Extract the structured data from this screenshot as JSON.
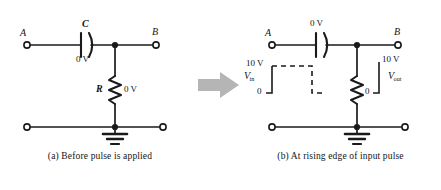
{
  "figure": {
    "type": "circuit-diagram",
    "background_color": "#ffffff",
    "line_color": "#1a1a1a",
    "arrow_color": "#b3b3b3",
    "transition_arrow": "right-arrow"
  },
  "panel_a": {
    "caption": "(a) Before pulse is applied",
    "terminal_top_left": "A",
    "terminal_top_right": "B",
    "capacitor_label": "C",
    "capacitor_voltage": "0 V",
    "resistor_label": "R",
    "resistor_voltage": "0 V",
    "ground": "ground-symbol"
  },
  "panel_b": {
    "caption": "(b) At rising edge of input pulse",
    "terminal_top_left": "A",
    "terminal_top_right": "B",
    "capacitor_voltage": "0 V",
    "input_signal_label": "V",
    "input_signal_sub": "in",
    "input_high": "10 V",
    "input_low": "0",
    "output_signal_label": "V",
    "output_signal_sub": "out",
    "output_high": "10 V",
    "output_low": "0",
    "ground": "ground-symbol"
  },
  "waveforms": {
    "vin": {
      "high_value": 10,
      "low_value": 0,
      "unit": "V",
      "rising_edge_style": "solid",
      "top_and_falling_style": "dashed"
    },
    "vout": {
      "high_value": 10,
      "low_value": 0,
      "unit": "V",
      "rising_edge_style": "solid"
    }
  }
}
